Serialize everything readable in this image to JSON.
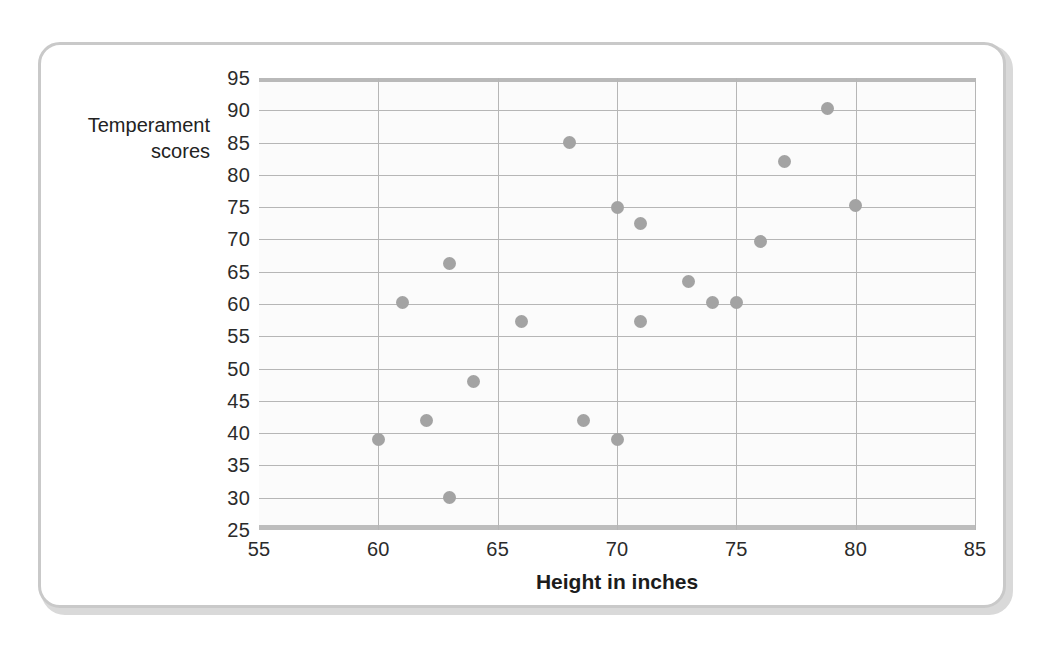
{
  "chart_data": {
    "type": "scatter",
    "title": "",
    "xlabel": "Height in inches",
    "ylabel": "Temperament scores",
    "ylabel_lines": [
      "Temperament",
      "scores"
    ],
    "xlim": [
      55,
      85
    ],
    "ylim": [
      25,
      95
    ],
    "xticks": [
      55,
      60,
      65,
      70,
      75,
      80,
      85
    ],
    "yticks": [
      25,
      30,
      35,
      40,
      45,
      50,
      55,
      60,
      65,
      70,
      75,
      80,
      85,
      90,
      95
    ],
    "grid": true,
    "legend": null,
    "series": [
      {
        "name": "Height vs Temperament",
        "marker": "circle",
        "color": "#a3a3a3",
        "points": [
          {
            "x": 60.0,
            "y": 39.0
          },
          {
            "x": 61.0,
            "y": 60.3
          },
          {
            "x": 62.0,
            "y": 42.0
          },
          {
            "x": 63.0,
            "y": 66.3
          },
          {
            "x": 63.0,
            "y": 30.0
          },
          {
            "x": 64.0,
            "y": 48.0
          },
          {
            "x": 66.0,
            "y": 57.3
          },
          {
            "x": 68.0,
            "y": 85.0
          },
          {
            "x": 68.6,
            "y": 42.0
          },
          {
            "x": 70.0,
            "y": 75.0
          },
          {
            "x": 70.0,
            "y": 39.0
          },
          {
            "x": 71.0,
            "y": 72.5
          },
          {
            "x": 71.0,
            "y": 57.3
          },
          {
            "x": 73.0,
            "y": 63.5
          },
          {
            "x": 74.0,
            "y": 60.3
          },
          {
            "x": 75.0,
            "y": 60.3
          },
          {
            "x": 76.0,
            "y": 69.7
          },
          {
            "x": 77.0,
            "y": 82.0
          },
          {
            "x": 78.8,
            "y": 90.3
          },
          {
            "x": 80.0,
            "y": 75.3
          }
        ]
      }
    ],
    "colors": {
      "marker": "#a3a3a3",
      "gridline": "#b6b6b6",
      "axis": "#bdbdbd",
      "text": "#2b2b2b",
      "card_border": "#c9c9c9",
      "plot_background": "#fbfbfb"
    }
  }
}
